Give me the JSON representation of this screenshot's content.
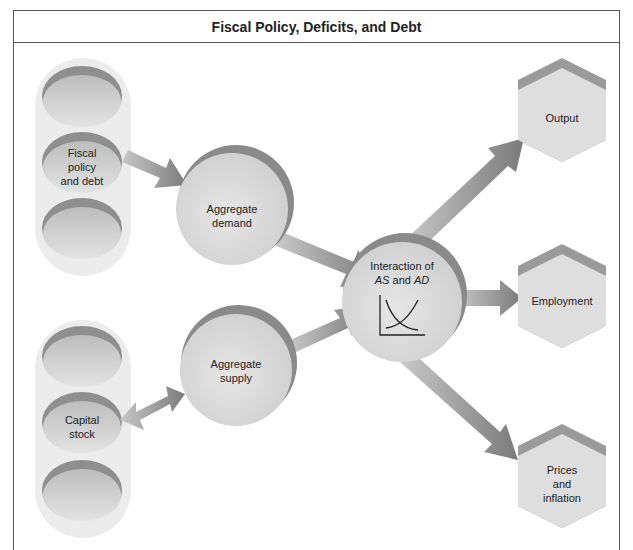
{
  "title": "Fiscal Policy, Deficits, and Debt",
  "nodes": {
    "fiscal_policy": {
      "line1": "Fiscal",
      "line2": "policy",
      "line3": "and debt"
    },
    "capital_stock": {
      "line1": "Capital",
      "line2": "stock"
    },
    "aggregate_demand": {
      "line1": "Aggregate",
      "line2": "demand"
    },
    "aggregate_supply": {
      "line1": "Aggregate",
      "line2": "supply"
    },
    "interaction": {
      "line1": "Interaction of",
      "as": "AS",
      "and": " and ",
      "ad": "AD"
    },
    "output": {
      "label": "Output"
    },
    "employment": {
      "label": "Employment"
    },
    "prices": {
      "line1": "Prices",
      "line2": "and",
      "line3": "inflation"
    }
  },
  "edges": [
    {
      "from": "fiscal_policy",
      "to": "aggregate_demand",
      "type": "one-way"
    },
    {
      "from": "capital_stock",
      "to": "aggregate_supply",
      "type": "two-way"
    },
    {
      "from": "aggregate_demand",
      "to": "interaction",
      "type": "one-way"
    },
    {
      "from": "aggregate_supply",
      "to": "interaction",
      "type": "one-way"
    },
    {
      "from": "interaction",
      "to": "output",
      "type": "one-way"
    },
    {
      "from": "interaction",
      "to": "employment",
      "type": "one-way"
    },
    {
      "from": "interaction",
      "to": "prices",
      "type": "one-way"
    }
  ],
  "colors": {
    "node_fill": "#dcdcdc",
    "node_shadow": "#8a8a8a",
    "arrow": "#8c8c8c",
    "pill": "#ececec",
    "border": "#555555"
  }
}
